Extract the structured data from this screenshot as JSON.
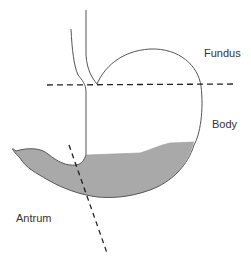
{
  "diagram": {
    "colors": {
      "outline": "#555555",
      "content_fill": "#a9a9a9",
      "dashed_line": "#222222",
      "label_text": "#333333",
      "background": "#ffffff"
    },
    "labels": {
      "fundus": "Fundus",
      "body": "Body",
      "antrum": "Antrum"
    }
  }
}
